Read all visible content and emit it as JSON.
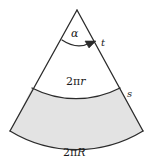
{
  "figure": {
    "apex_angle_label": "α",
    "slant_upper_label": "t",
    "slant_lower_label": "s",
    "inner_arc_label": "2πr",
    "outer_arc_label": "2πR",
    "shaded_region_fill": "#e3e3e3",
    "stroke_color": "#2b2b2b",
    "background": "#ffffff"
  },
  "chart_data": {
    "type": "diagram",
    "elements": [
      {
        "name": "apex",
        "kind": "point",
        "x": 77,
        "y": 10
      },
      {
        "name": "left-slant-edge",
        "kind": "line",
        "from": [
          77,
          10
        ],
        "to": [
          10,
          131
        ]
      },
      {
        "name": "right-slant-edge",
        "kind": "line",
        "from": [
          77,
          10
        ],
        "to": [
          143,
          131
        ]
      },
      {
        "name": "inner-arc",
        "kind": "arc",
        "from": [
          32,
          88
        ],
        "to": [
          120,
          88
        ],
        "sagitta": 9,
        "label": "2πr"
      },
      {
        "name": "outer-arc",
        "kind": "arc",
        "from": [
          10,
          131
        ],
        "to": [
          143,
          131
        ],
        "sagitta": 13,
        "label": "2πR"
      },
      {
        "name": "angle-arrow",
        "kind": "curved-arrow",
        "from": [
          63,
          41
        ],
        "to": [
          93,
          44
        ],
        "label": "α"
      }
    ],
    "shaded": [
      "region-between-inner-and-outer-arc"
    ],
    "labels": [
      "α",
      "t",
      "2πr",
      "s",
      "2πR"
    ]
  }
}
